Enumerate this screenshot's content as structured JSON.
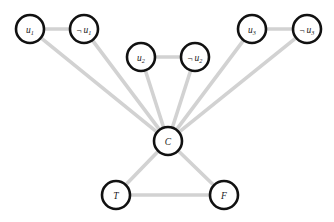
{
  "figure": {
    "kind": "undirected-graph-diagram",
    "width": 334,
    "height": 222,
    "background_color": "#ffffff",
    "node_fill_color": "#ffffff",
    "node_stroke_color": "#111111",
    "edge_color": "#d2d2d2",
    "label_color": "#1a1a1a"
  },
  "nodes": [
    {
      "id": "u1",
      "label_main": "u",
      "label_sub": "1",
      "negated": false,
      "label_text": "u1",
      "x": 30,
      "y": 29,
      "r": 14
    },
    {
      "id": "nu1",
      "label_main": "u",
      "label_sub": "1",
      "negated": true,
      "label_text": "¬ u1",
      "x": 84,
      "y": 29,
      "r": 14
    },
    {
      "id": "u2",
      "label_main": "u",
      "label_sub": "2",
      "negated": false,
      "label_text": "u2",
      "x": 141,
      "y": 57,
      "r": 14
    },
    {
      "id": "nu2",
      "label_main": "u",
      "label_sub": "2",
      "negated": true,
      "label_text": "¬ u2",
      "x": 195,
      "y": 57,
      "r": 14
    },
    {
      "id": "u3",
      "label_main": "u",
      "label_sub": "3",
      "negated": false,
      "label_text": "u3",
      "x": 252,
      "y": 29,
      "r": 14
    },
    {
      "id": "nu3",
      "label_main": "u",
      "label_sub": "3",
      "negated": true,
      "label_text": "¬ u3",
      "x": 307,
      "y": 29,
      "r": 14
    },
    {
      "id": "C",
      "label_main": "C",
      "label_sub": "",
      "negated": false,
      "label_text": "C",
      "x": 168,
      "y": 141,
      "r": 14
    },
    {
      "id": "T",
      "label_main": "T",
      "label_sub": "",
      "negated": false,
      "label_text": "T",
      "x": 116,
      "y": 195,
      "r": 14
    },
    {
      "id": "F",
      "label_main": "F",
      "label_sub": "",
      "negated": false,
      "label_text": "F",
      "x": 224,
      "y": 195,
      "r": 14
    }
  ],
  "edges": [
    {
      "from": "u1",
      "to": "nu1"
    },
    {
      "from": "u2",
      "to": "nu2"
    },
    {
      "from": "u3",
      "to": "nu3"
    },
    {
      "from": "u1",
      "to": "C"
    },
    {
      "from": "nu1",
      "to": "C"
    },
    {
      "from": "u2",
      "to": "C"
    },
    {
      "from": "nu2",
      "to": "C"
    },
    {
      "from": "u3",
      "to": "C"
    },
    {
      "from": "nu3",
      "to": "C"
    },
    {
      "from": "C",
      "to": "T"
    },
    {
      "from": "C",
      "to": "F"
    },
    {
      "from": "T",
      "to": "F"
    }
  ]
}
